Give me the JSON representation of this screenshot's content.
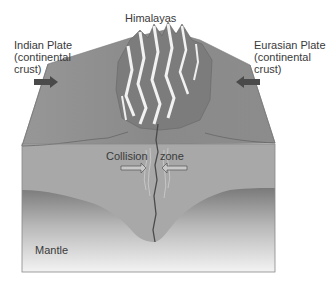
{
  "diagram": {
    "title": "Himalayas",
    "left_plate": {
      "line1": "Indian Plate",
      "line2": "(continental",
      "line3": "crust)"
    },
    "right_plate": {
      "line1": "Eurasian Plate",
      "line2": "(continental",
      "line3": "crust)"
    },
    "collision_word1": "Collision",
    "collision_word2": "zone",
    "mantle": "Mantle",
    "colors": {
      "crust_top": "#8f8f8f",
      "crust_front": "#a9a9a9",
      "mantle_dark": "#6f6f6f",
      "mantle_light": "#f2f2f2",
      "arrow": "#4a4a4a",
      "fault": "#4a4a4a"
    }
  }
}
